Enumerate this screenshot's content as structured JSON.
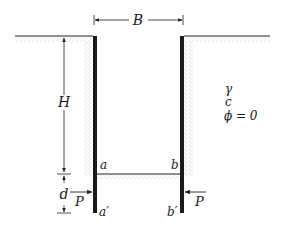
{
  "figure": {
    "type": "braced-cut-excavation",
    "labels": {
      "width": "B",
      "height": "H",
      "depth": "d",
      "force_left": "P",
      "force_right": "P",
      "point_a": "a",
      "point_b": "b",
      "point_a_prime": "a′",
      "point_b_prime": "b′"
    },
    "soil_properties": {
      "unit_weight": "γ",
      "cohesion": "c",
      "friction_angle": "ϕ = 0"
    },
    "colors": {
      "wall": "#1a1a1a",
      "line": "#222222",
      "stipple": "#9a9a9a",
      "background": "#ffffff"
    }
  }
}
